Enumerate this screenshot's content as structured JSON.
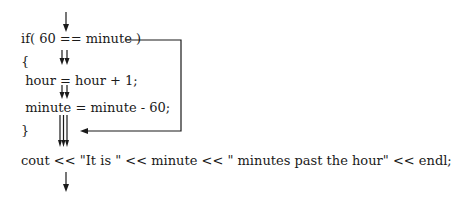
{
  "diagram": {
    "title": "",
    "code_lines": [
      {
        "id": "if-line",
        "text": "if( 60 == minute )"
      },
      {
        "id": "open-brace",
        "text": "{"
      },
      {
        "id": "hour-line",
        "text": " hour = hour + 1;"
      },
      {
        "id": "minute-line",
        "text": " minute = minute - 60;"
      },
      {
        "id": "close-brace",
        "text": "}"
      },
      {
        "id": "cout-line",
        "text": "cout << \"It is \" << minute << \" minutes past the hour\" << endl;"
      }
    ],
    "flow": {
      "entry_arrow": "single arrow into if condition",
      "true_branch": "double arrow into block",
      "false_branch": "bypass line from if condition to after closing brace",
      "merge": "three parallel arrows converge before cout",
      "exit_arrow": "single arrow out of cout"
    },
    "colors": {
      "text": "#1a1a1a",
      "lines": "#1a1a1a",
      "background": "#ffffff"
    }
  }
}
